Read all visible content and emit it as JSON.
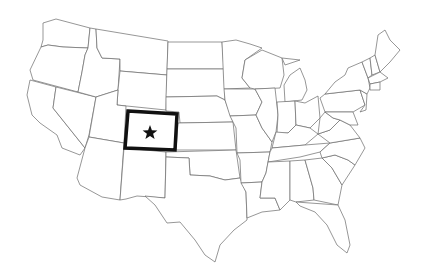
{
  "map": {
    "title": "United States",
    "highlighted_state": "Colorado",
    "marker": "star-icon",
    "colors": {
      "background": "#ffffff",
      "state_fill": "#ffffff",
      "state_border": "#6a6a6a",
      "highlight_border": "#111111",
      "marker": "#111111"
    }
  }
}
